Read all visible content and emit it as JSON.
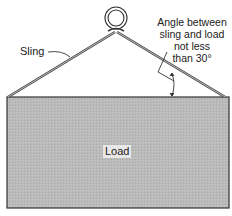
{
  "diagram": {
    "type": "rigging-sling-load",
    "labels": {
      "sling": "Sling",
      "load": "Load",
      "angle_note": [
        "Angle between",
        "sling and load",
        "not less",
        "than 30°"
      ]
    },
    "colors": {
      "load_fill": "#b9b9b9",
      "outline": "#333333",
      "background": "#ffffff"
    }
  }
}
